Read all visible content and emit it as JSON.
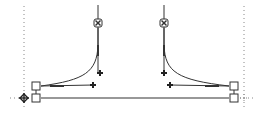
{
  "diagram": {
    "type": "bezier-path-editor",
    "colors": {
      "stroke": "#333333",
      "guide": "#888888",
      "handle_fill": "#ffffff",
      "background": "#ffffff"
    },
    "guides": {
      "left_x": 24,
      "right_x": 244
    },
    "anchors": [
      {
        "name": "left-anchor",
        "x": 24,
        "y": 98
      },
      {
        "name": "right-anchor",
        "x": 244,
        "y": 98
      }
    ],
    "nodes": [
      {
        "name": "left-upper-node",
        "x": 36,
        "y": 87
      },
      {
        "name": "left-lower-node",
        "x": 36,
        "y": 98
      },
      {
        "name": "right-upper-node",
        "x": 234,
        "y": 87
      },
      {
        "name": "right-lower-node",
        "x": 234,
        "y": 98
      }
    ],
    "control_handles": [
      {
        "name": "left-top-handle",
        "x": 98,
        "y": 23
      },
      {
        "name": "right-top-handle",
        "x": 164,
        "y": 23
      }
    ],
    "control_points": [
      {
        "name": "left-vertical-control",
        "x": 100,
        "y": 73
      },
      {
        "name": "left-horizontal-control",
        "x": 93,
        "y": 84
      },
      {
        "name": "right-vertical-control",
        "x": 164,
        "y": 73
      },
      {
        "name": "right-horizontal-control",
        "x": 170,
        "y": 84
      }
    ]
  }
}
